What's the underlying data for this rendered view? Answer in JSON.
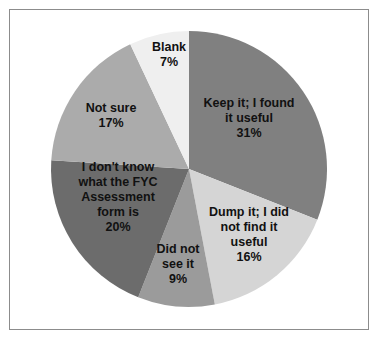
{
  "chart_data": {
    "type": "pie",
    "title": "",
    "start_angle_deg": 0,
    "direction": "clockwise",
    "slices": [
      {
        "label": "Keep it; I found it useful",
        "lines": [
          "Keep it; I found",
          "it useful",
          "31%"
        ],
        "value": 31,
        "color": "#808080"
      },
      {
        "label": "Dump it; I did not find it useful",
        "lines": [
          "Dump it; I did",
          "not find it",
          "useful",
          "16%"
        ],
        "value": 16,
        "color": "#d5d5d5"
      },
      {
        "label": "Did not see it",
        "lines": [
          "Did not",
          "see it",
          "9%"
        ],
        "value": 9,
        "color": "#9b9b9b"
      },
      {
        "label": "I don't know what the FYC Assessment form is",
        "lines": [
          "I don't know",
          "what the FYC",
          "Assessment",
          "form is",
          "20%"
        ],
        "value": 20,
        "color": "#6c6c6c"
      },
      {
        "label": "Not sure",
        "lines": [
          "Not sure",
          "17%"
        ],
        "value": 17,
        "color": "#ababab"
      },
      {
        "label": "Blank",
        "lines": [
          "Blank",
          "7%"
        ],
        "value": 7,
        "color": "#efefef"
      }
    ],
    "legend": "none",
    "data_labels": "inside"
  }
}
